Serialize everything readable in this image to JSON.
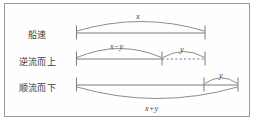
{
  "figure": {
    "border_color": "#9a9a9a",
    "line_color": "#6e6e6e",
    "text_color": "#3b3b3b",
    "background": "#fefefe"
  },
  "rows": [
    {
      "id": "boat-speed",
      "label": "船速",
      "segments": [
        {
          "id": "x",
          "label": "x"
        }
      ]
    },
    {
      "id": "upstream",
      "label": "逆流而上",
      "segments": [
        {
          "id": "x-minus-y",
          "label": "x−y"
        },
        {
          "id": "y-upstream",
          "label": "y"
        }
      ]
    },
    {
      "id": "downstream",
      "label": "顺流而下",
      "segments": [
        {
          "id": "y-downstream",
          "label": "y"
        },
        {
          "id": "x-plus-y",
          "label": "x+y"
        }
      ]
    }
  ],
  "labels": {
    "x": "x",
    "x_minus_y": "x−y",
    "y_upstream": "y",
    "y_downstream": "y",
    "x_plus_y": "x+y",
    "row1": "船速",
    "row2": "逆流而上",
    "row3": "顺流而下"
  }
}
